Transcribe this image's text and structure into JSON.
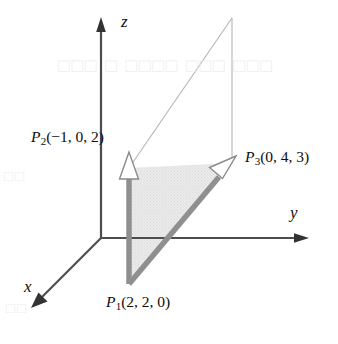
{
  "figure": {
    "background_color": "#ffffff",
    "axis_color": "#4d4d4d",
    "vector_color": "#8c8c8c",
    "outline_color": "#b0b0b0",
    "shade_fill": "#e8e8e8",
    "text_color": "#0d0d0d"
  },
  "axes": {
    "z": {
      "label": "z",
      "direction": "up"
    },
    "y": {
      "label": "y",
      "direction": "right"
    },
    "x": {
      "label": "x",
      "direction": "down-left"
    },
    "origin_px": {
      "x": 101,
      "y": 238
    }
  },
  "points": [
    {
      "id": "P1",
      "name": "P",
      "subscript": "1",
      "coords": "(2, 2, 0)",
      "full_label": "P1(2, 2, 0)",
      "position_px": {
        "x": 129,
        "y": 284
      }
    },
    {
      "id": "P2",
      "name": "P",
      "subscript": "2",
      "coords": "(−1, 0, 2)",
      "full_label": "P2(−1, 0, 2)",
      "position_px": {
        "x": 129,
        "y": 168
      }
    },
    {
      "id": "P3",
      "name": "P",
      "subscript": "3",
      "coords": "(0, 4, 3)",
      "full_label": "P3(0, 4, 3)",
      "position_px": {
        "x": 232,
        "y": 163
      }
    }
  ],
  "vectors": [
    {
      "id": "v1",
      "from": "P1",
      "to": "P2",
      "style": "thick-gray-shaft-open-arrowhead"
    },
    {
      "id": "v2",
      "from": "P1",
      "to": "P3",
      "style": "thick-gray-shaft-open-arrowhead"
    }
  ],
  "shaded_region": {
    "id": "triangle-P1-P2-P3",
    "fill": "#e8e8e8",
    "description": "light gray halftone triangle bounded by the two vectors"
  },
  "outline_region": {
    "id": "parallelogram-outline",
    "stroke": "#b0b0b0",
    "apex_px": {
      "x": 232,
      "y": 18
    },
    "description": "thin line outline completing the parallelogram above the arrowheads"
  },
  "bleed_through": {
    "line_1": "□□□ □ □□□□ □□□ □□□",
    "line_2": "□□",
    "line_3": "□□"
  }
}
